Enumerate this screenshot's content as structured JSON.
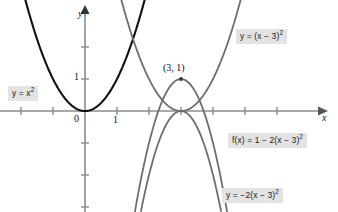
{
  "figure": {
    "background_color": "#ffffff"
  },
  "axes": {
    "x_axis_label": "x",
    "y_axis_label": "y",
    "origin_label": "0",
    "x_tick_label": "1",
    "y_tick_label": "1",
    "x_axis_color": "#8c8c8c",
    "y_axis_color": "#8c8c8c"
  },
  "annotations": {
    "vertex_point_label": "(3, 1)"
  },
  "labels": {
    "y_eq_x_squared": {
      "prefix": "y = x",
      "exponent": "2"
    },
    "y_eq_x_minus_3_squared": {
      "prefix": "y = (x − 3)",
      "exponent": "2"
    },
    "f_of_x": {
      "prefix": "f(x) = 1 − 2(x − 3)",
      "exponent": "2"
    },
    "y_eq_neg2_x_minus_3_squared": {
      "prefix": "y = −2(x − 3)",
      "exponent": "2"
    }
  },
  "chart_data": {
    "type": "line",
    "title": "",
    "xlabel": "x",
    "ylabel": "y",
    "xlim": [
      -2.7,
      7.3
    ],
    "ylim": [
      -3.2,
      3.5
    ],
    "grid": false,
    "legend": "inline-labels",
    "x_ticks": [
      1,
      2,
      3,
      4,
      5,
      6
    ],
    "x_tick_labels_shown": [
      "1"
    ],
    "y_ticks": [
      -2,
      -1,
      1,
      2
    ],
    "y_tick_labels_shown": [
      "1"
    ],
    "origin_label": "0",
    "unit_px": 32,
    "origin_px": [
      85,
      111
    ],
    "annotated_points": [
      {
        "label": "(3, 1)",
        "x": 3,
        "y": 1,
        "marker": "dot"
      }
    ],
    "series": [
      {
        "name": "y = x²",
        "equation": "y = x^2",
        "color": "#111111",
        "width": 2.1,
        "vertex": [
          0,
          0
        ],
        "a": 1,
        "h": 0,
        "k": 0,
        "x_range": [
          -2.45,
          2.45
        ]
      },
      {
        "name": "y = (x − 3)²",
        "equation": "y = (x - 3)^2",
        "color": "#6e6e6e",
        "width": 1.8,
        "vertex": [
          3,
          0
        ],
        "a": 1,
        "h": 3,
        "k": 0,
        "x_range": [
          0.55,
          5.45
        ]
      },
      {
        "name": "f(x) = 1 − 2(x − 3)²",
        "equation": "f(x) = 1 - 2(x - 3)^2",
        "color": "#6e6e6e",
        "width": 1.8,
        "vertex": [
          3,
          1
        ],
        "a": -2,
        "h": 3,
        "k": 1,
        "x_range": [
          1.55,
          4.45
        ]
      },
      {
        "name": "y = −2(x − 3)²",
        "equation": "y = -2(x - 3)^2",
        "color": "#6e6e6e",
        "width": 1.8,
        "vertex": [
          3,
          0
        ],
        "a": -2,
        "h": 3,
        "k": 0,
        "x_range": [
          1.75,
          4.25
        ]
      }
    ]
  }
}
